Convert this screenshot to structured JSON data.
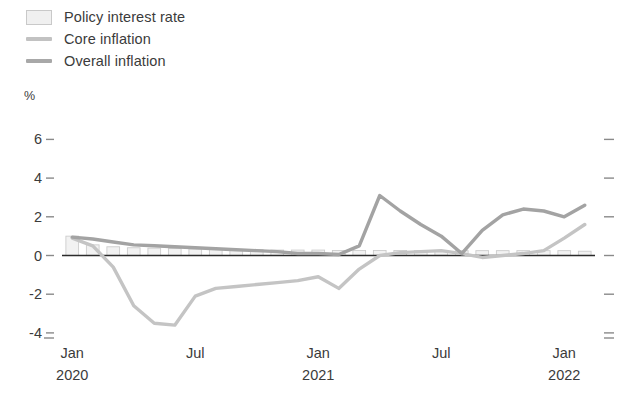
{
  "legend": {
    "items": [
      {
        "label": "Policy interest rate",
        "marker": "bar-swatch-icon",
        "color": "#f0f0f0"
      },
      {
        "label": "Core inflation",
        "marker": "line-swatch-icon",
        "color": "#c4c4c4"
      },
      {
        "label": "Overall inflation",
        "marker": "line-swatch-icon",
        "color": "#a3a3a3"
      }
    ]
  },
  "axes": {
    "unit_label": "%",
    "y_ticks": [
      "6",
      "4",
      "2",
      "0",
      "-2",
      "-4"
    ],
    "x_tick_primary": [
      "Jan",
      "Jul",
      "Jan",
      "Jul",
      "Jan"
    ],
    "x_tick_secondary": [
      "2020",
      "",
      "2021",
      "",
      "2022"
    ]
  },
  "chart_data": {
    "type": "line",
    "title": "",
    "xlabel": "",
    "ylabel": "%",
    "ylim": [
      -5,
      7
    ],
    "grid": false,
    "legend_position": "top-left",
    "x": [
      "Jan 2020",
      "Feb 2020",
      "Mar 2020",
      "Apr 2020",
      "May 2020",
      "Jun 2020",
      "Jul 2020",
      "Aug 2020",
      "Sep 2020",
      "Oct 2020",
      "Nov 2020",
      "Dec 2020",
      "Jan 2021",
      "Feb 2021",
      "Mar 2021",
      "Apr 2021",
      "May 2021",
      "Jun 2021",
      "Jul 2021",
      "Aug 2021",
      "Sep 2021",
      "Oct 2021",
      "Nov 2021",
      "Dec 2021",
      "Jan 2022",
      "Feb 2022"
    ],
    "series": [
      {
        "name": "Policy interest rate",
        "type": "bar",
        "color": "#f2f2f2",
        "values": [
          1.0,
          0.55,
          0.45,
          0.4,
          0.38,
          0.36,
          0.34,
          0.32,
          0.3,
          0.3,
          0.28,
          0.28,
          0.28,
          0.26,
          0.26,
          0.26,
          0.26,
          0.25,
          0.25,
          0.25,
          0.25,
          0.25,
          0.25,
          0.25,
          0.25,
          0.22
        ]
      },
      {
        "name": "Core inflation",
        "type": "line",
        "color": "#c4c4c4",
        "values": [
          0.9,
          0.5,
          -0.6,
          -2.6,
          -3.5,
          -3.6,
          -2.1,
          -1.7,
          -1.6,
          -1.5,
          -1.4,
          -1.3,
          -1.1,
          -1.7,
          -0.7,
          0.0,
          0.15,
          0.2,
          0.25,
          0.1,
          -0.1,
          0.0,
          0.1,
          0.25,
          0.9,
          1.6
        ]
      },
      {
        "name": "Overall inflation",
        "type": "line",
        "color": "#a3a3a3",
        "values": [
          0.95,
          0.85,
          0.7,
          0.55,
          0.5,
          0.45,
          0.4,
          0.35,
          0.3,
          0.25,
          0.2,
          0.1,
          0.1,
          0.05,
          0.5,
          3.1,
          2.3,
          1.6,
          1.0,
          0.1,
          1.3,
          2.1,
          2.4,
          2.3,
          2.0,
          2.6
        ]
      }
    ],
    "annotations": []
  },
  "footnote": {
    "text": ""
  }
}
